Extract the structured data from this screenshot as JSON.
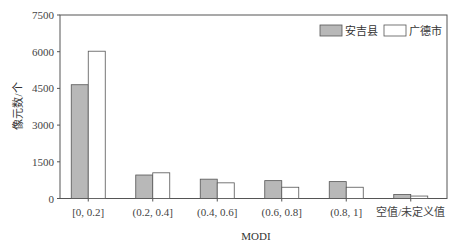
{
  "chart_data": {
    "type": "bar",
    "title": "",
    "xlabel": "MODI",
    "ylabel": "像元数/个",
    "ylim": [
      0,
      7500
    ],
    "yticks": [
      0,
      1500,
      3000,
      4500,
      6000,
      7500
    ],
    "grid": false,
    "legend_position": "top-right",
    "categories": [
      "[0, 0.2]",
      "(0.2, 0.4]",
      "(0.4, 0.6]",
      "(0.6, 0.8]",
      "(0.8, 1]",
      "空值/未定义值"
    ],
    "series": [
      {
        "name": "安吉县",
        "color": "#b8b8b8",
        "values": [
          4650,
          960,
          790,
          730,
          690,
          160
        ]
      },
      {
        "name": "广德市",
        "color": "#ffffff",
        "values": [
          6020,
          1050,
          640,
          460,
          460,
          100
        ]
      }
    ]
  }
}
